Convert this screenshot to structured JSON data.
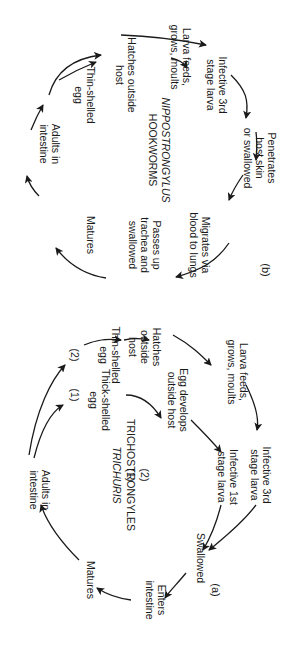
{
  "figure": {
    "orientation": "rotated 90 degrees clockwise",
    "panel_a": {
      "label": "(a)",
      "titles": [
        {
          "num": "(1)",
          "name": "TRICHURIS",
          "italic": true
        },
        {
          "num": "(2)",
          "name": "TRICHOSTRONGYLES",
          "italic": false
        }
      ],
      "branch_markers": [
        "(1)",
        "(2)"
      ],
      "nodes": {
        "adults": "Adults in\nintestine",
        "thick_egg": "Thick-shelled\negg",
        "thin_egg": "Thin-shelled\negg",
        "hatches": "Hatches\noutside\nhost",
        "egg_develops": "Egg develops\noutside host",
        "larva_feeds": "Larva feeds,\ngrows, moults",
        "infective_1st": "Infective 1st\nstage larva",
        "infective_3rd": "Infective 3rd\nstage larva",
        "swallowed": "Swallowed",
        "enters": "Enters\nintestine",
        "matures": "Matures"
      }
    },
    "panel_b": {
      "label": "(b)",
      "titles": [
        {
          "name": "HOOKWORMS",
          "italic": false
        },
        {
          "name": "NIPPOSTRONGYLUS",
          "italic": true
        }
      ],
      "nodes": {
        "adults": "Adults in\nintestine",
        "thin_egg": "Thin-shelled\negg",
        "hatches": "Hatches outside\nhost",
        "larva_feeds": "Larva feeds,\ngrows, moults",
        "infective_3rd": "Infective 3rd\nstage larva",
        "penetrates": "Penetrates\nhost skin\nor swallowed",
        "migrates": "Migrates via\nblood to lungs",
        "passes_up": "Passes up\ntrachea and\nswallowed",
        "matures": "Matures"
      }
    }
  },
  "colors": {
    "ink": "#1a1a1a",
    "background": "#ffffff"
  }
}
